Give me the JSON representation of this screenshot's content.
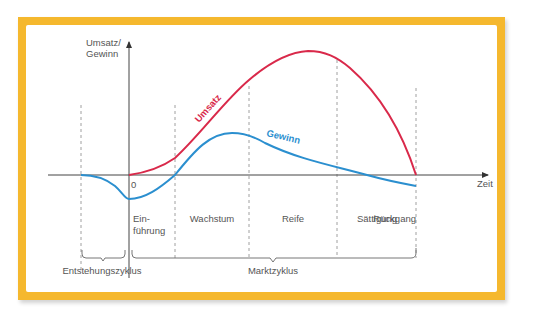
{
  "diagram": {
    "y_axis_label_line1": "Umsatz/",
    "y_axis_label_line2": "Gewinn",
    "x_axis_label": "Zeit",
    "origin_label": "0",
    "curves": {
      "umsatz": {
        "label": "Umsatz",
        "color": "#d9294a"
      },
      "gewinn": {
        "label": "Gewinn",
        "color": "#2b8fcf"
      }
    },
    "phases": [
      {
        "label_line1": "Ein-",
        "label_line2": "führung"
      },
      {
        "label_line1": "Wachstum"
      },
      {
        "label_line1": "Reife"
      },
      {
        "label_line1": "Sättigung"
      },
      {
        "label_line1": "Rückgang"
      }
    ],
    "cycles": {
      "development": "Entstehungszyklus",
      "market": "Marktzyklus"
    },
    "frame_color": "#f5b82e"
  }
}
